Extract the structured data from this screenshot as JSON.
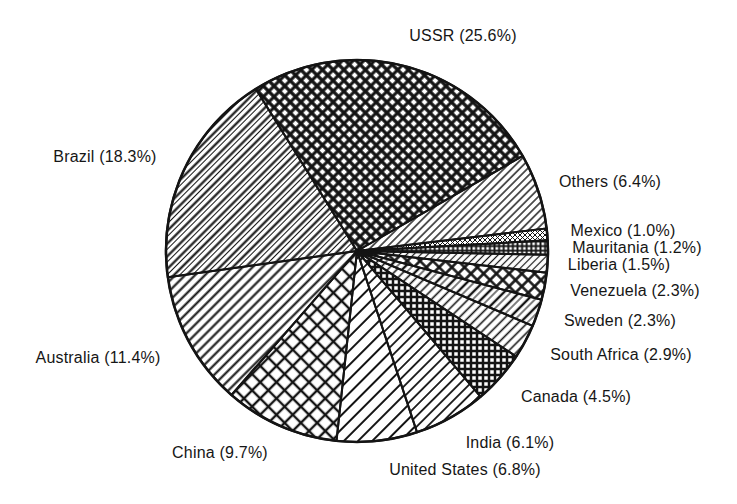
{
  "figure": {
    "background": "#ffffff",
    "ink_color": "#141414"
  },
  "chart_data": {
    "type": "pie",
    "title": "",
    "unit": "%",
    "total": 100.0,
    "start_angle_deg": 122,
    "direction": "clockwise",
    "grid": false,
    "legend_position": "labels-around-pie",
    "style": "monochrome-hatched",
    "slices": [
      {
        "name": "USSR",
        "value": 25.6,
        "label": "USSR (25.6%)",
        "pattern": "diamond-dense",
        "label_x": 463,
        "label_y": 36
      },
      {
        "name": "Others",
        "value": 6.4,
        "label": "Others (6.4%)",
        "pattern": "diag-thin",
        "label_x": 610,
        "label_y": 182
      },
      {
        "name": "Mexico",
        "value": 1.0,
        "label": "Mexico (1.0%)",
        "pattern": "cross-fine",
        "label_x": 623,
        "label_y": 231
      },
      {
        "name": "Mauritania",
        "value": 1.2,
        "label": "Mauritania (1.2%)",
        "pattern": "checker-fine",
        "label_x": 637,
        "label_y": 248
      },
      {
        "name": "Liberia",
        "value": 1.5,
        "label": "Liberia (1.5%)",
        "pattern": "diag-fine",
        "label_x": 619,
        "label_y": 265
      },
      {
        "name": "Venezuela",
        "value": 2.3,
        "label": "Venezuela (2.3%)",
        "pattern": "diamond-med",
        "label_x": 635,
        "label_y": 291
      },
      {
        "name": "Sweden",
        "value": 2.3,
        "label": "Sweden (2.3%)",
        "pattern": "diag-pair",
        "label_x": 620,
        "label_y": 321
      },
      {
        "name": "South Africa",
        "value": 2.9,
        "label": "South Africa (2.9%)",
        "pattern": "diag-med",
        "label_x": 621,
        "label_y": 355
      },
      {
        "name": "Canada",
        "value": 4.5,
        "label": "Canada (4.5%)",
        "pattern": "checker-med",
        "label_x": 576,
        "label_y": 397
      },
      {
        "name": "India",
        "value": 6.1,
        "label": "India (6.1%)",
        "pattern": "diag-med2",
        "label_x": 510,
        "label_y": 443
      },
      {
        "name": "United States",
        "value": 6.8,
        "label": "United States (6.8%)",
        "pattern": "diag-wide",
        "label_x": 465,
        "label_y": 470
      },
      {
        "name": "China",
        "value": 9.7,
        "label": "China (9.7%)",
        "pattern": "diamond-large",
        "label_x": 220,
        "label_y": 453
      },
      {
        "name": "Australia",
        "value": 11.4,
        "label": "Australia (11.4%)",
        "pattern": "diag-wide2",
        "label_x": 98,
        "label_y": 358
      },
      {
        "name": "Brazil",
        "value": 18.3,
        "label": "Brazil (18.3%)",
        "pattern": "diag-brazil",
        "label_x": 105,
        "label_y": 157
      }
    ]
  }
}
